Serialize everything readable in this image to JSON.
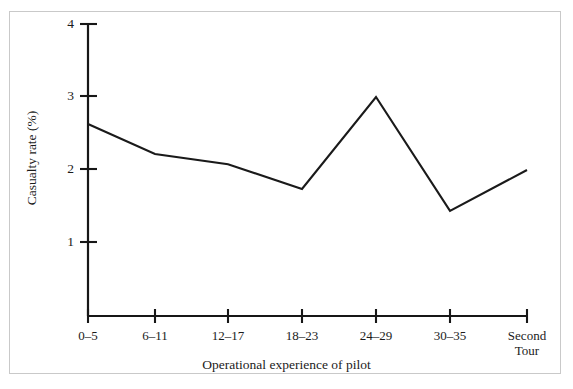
{
  "chart_data": {
    "type": "line",
    "title": "",
    "subtitle": "",
    "xlabel": "Operational experience of pilot",
    "ylabel": "Casualty rate (%)",
    "categories": [
      "0–5",
      "6–11",
      "12–17",
      "18–23",
      "24–29",
      "30–35",
      "Second\nTour"
    ],
    "values": [
      2.63,
      2.22,
      2.08,
      1.74,
      3.0,
      1.44,
      2.0
    ],
    "series": [
      {
        "name": "Casualty rate",
        "values": [
          2.63,
          2.22,
          2.08,
          1.74,
          3.0,
          1.44,
          2.0
        ]
      }
    ],
    "ylim": [
      0,
      4
    ],
    "yticks": [
      1,
      2,
      3,
      4
    ],
    "ytick_labels": [
      "1",
      "2",
      "3",
      "4"
    ],
    "grid": false,
    "legend": false,
    "legend_position": "none",
    "line_color": "#1a1a1a",
    "axis_color": "#171717",
    "background_color": "#ffffff",
    "border_color": "#c9c9c9"
  },
  "axes": {
    "y_title": "Casualty rate (%)",
    "x_title": "Operational experience of pilot"
  },
  "ytick_labels": [
    {
      "text": "4"
    },
    {
      "text": "3"
    },
    {
      "text": "2"
    },
    {
      "text": "1"
    }
  ],
  "xtick_labels": [
    {
      "text": "0–5"
    },
    {
      "text": "6–11"
    },
    {
      "text": "12–17"
    },
    {
      "text": "18–23"
    },
    {
      "text": "24–29"
    },
    {
      "text": "30–35"
    },
    {
      "text": "Second\nTour"
    }
  ]
}
